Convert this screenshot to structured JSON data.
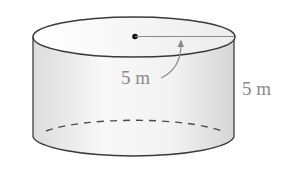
{
  "diagram": {
    "type": "cylinder",
    "radius_label": "5 m",
    "height_label": "5 m",
    "colors": {
      "outline": "#3a3a3a",
      "annotation": "#8a8a8a",
      "fill_light": "#f7f7f7",
      "fill_dark": "#dedede"
    }
  }
}
